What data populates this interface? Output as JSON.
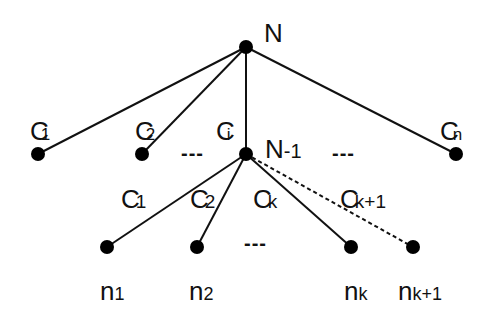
{
  "diagram": {
    "type": "tree",
    "colors": {
      "line": "#111111",
      "node": "#000000",
      "background": "#ffffff"
    },
    "nodes": {
      "root": {
        "label": "N",
        "sub": "",
        "x": 246,
        "y": 47
      },
      "c1": {
        "x": 38,
        "y": 154
      },
      "c2": {
        "x": 142,
        "y": 154
      },
      "ci": {
        "label": "N",
        "sub": "-1",
        "x": 246,
        "y": 154
      },
      "cn": {
        "x": 456,
        "y": 154
      },
      "n1": {
        "label": "n",
        "sub": "1",
        "x": 107,
        "y": 247
      },
      "n2": {
        "label": "n",
        "sub": "2",
        "x": 197,
        "y": 247
      },
      "nk": {
        "label": "n",
        "sub": "k",
        "x": 351,
        "y": 247
      },
      "nk1": {
        "label": "n",
        "sub": "k+1",
        "x": 413,
        "y": 247
      }
    },
    "edge_labels": {
      "c1": {
        "main": "C",
        "sub": "1"
      },
      "c2": {
        "main": "C",
        "sub": "2"
      },
      "ci": {
        "main": "C",
        "sub": "i"
      },
      "cn": {
        "main": "C",
        "sub": "n"
      },
      "g1": {
        "main": "C",
        "sub": "1"
      },
      "g2": {
        "main": "C",
        "sub": "2"
      },
      "gk": {
        "main": "C",
        "sub": "k"
      },
      "gk1": {
        "main": "C",
        "sub": "k+1"
      }
    },
    "ellipses": [
      "---",
      "---",
      "---"
    ],
    "edges": [
      {
        "from": "root",
        "to": "c1",
        "style": "solid"
      },
      {
        "from": "root",
        "to": "c2",
        "style": "solid"
      },
      {
        "from": "root",
        "to": "ci",
        "style": "solid"
      },
      {
        "from": "root",
        "to": "cn",
        "style": "solid"
      },
      {
        "from": "ci",
        "to": "n1",
        "style": "solid"
      },
      {
        "from": "ci",
        "to": "n2",
        "style": "solid"
      },
      {
        "from": "ci",
        "to": "nk",
        "style": "solid"
      },
      {
        "from": "ci",
        "to": "nk1",
        "style": "dashed"
      }
    ]
  }
}
